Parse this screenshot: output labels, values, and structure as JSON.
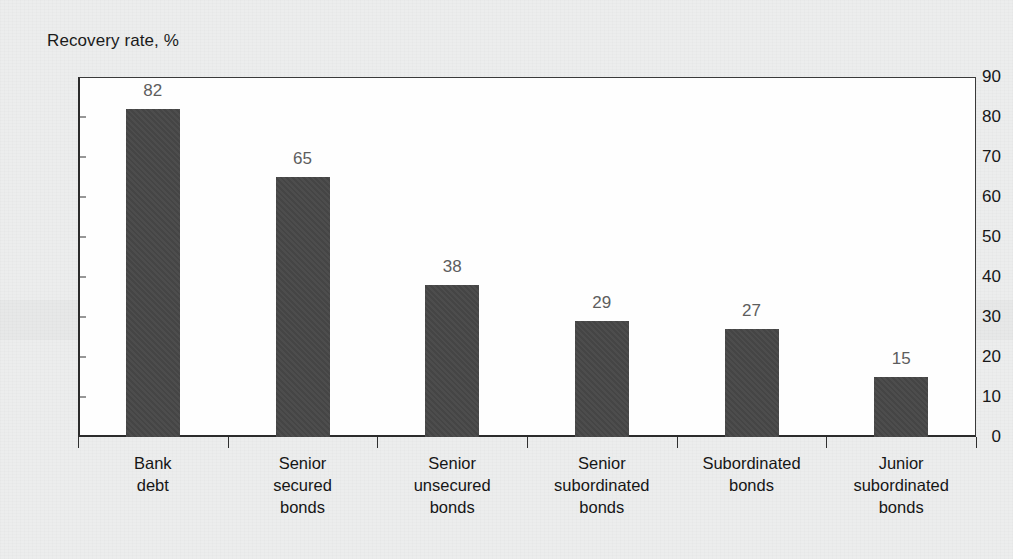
{
  "figure": {
    "background_color": "#eceded",
    "plot_background_color": "#fefefe",
    "bar_color": "#474747",
    "axis_color": "#2b2b2b",
    "value_label_color": "#5d5d5d",
    "axis_label_color": "#181818"
  },
  "chart_data": {
    "type": "bar",
    "title": "Recovery rate, %",
    "xlabel": "",
    "ylabel": "Recovery rate, %",
    "ylim": [
      0,
      90
    ],
    "ytick_step": 10,
    "grid": false,
    "legend": null,
    "categories": [
      "Bank debt",
      "Senior secured bonds",
      "Senior unsecured bonds",
      "Senior subordinated bonds",
      "Subordinated bonds",
      "Junior subordinated bonds"
    ],
    "category_lines": [
      [
        "Bank",
        "debt"
      ],
      [
        "Senior",
        "secured",
        "bonds"
      ],
      [
        "Senior",
        "unsecured",
        "bonds"
      ],
      [
        "Senior",
        "subordinated",
        "bonds"
      ],
      [
        "Subordinated",
        "bonds"
      ],
      [
        "Junior",
        "subordinated",
        "bonds"
      ]
    ],
    "values": [
      82,
      65,
      38,
      29,
      27,
      15
    ],
    "value_labels": [
      "82",
      "65",
      "38",
      "29",
      "27",
      "15"
    ],
    "ytick_labels": [
      "90",
      "80",
      "70",
      "60",
      "50",
      "40",
      "30",
      "20",
      "10",
      "0"
    ],
    "yticks": [
      90,
      80,
      70,
      60,
      50,
      40,
      30,
      20,
      10,
      0
    ]
  }
}
